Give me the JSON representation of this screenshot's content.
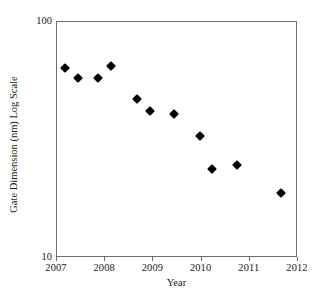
{
  "chart_data": {
    "type": "scatter",
    "title": "",
    "xlabel": "Year",
    "ylabel": "Gate Dimension (nm) Log Scale",
    "xlim": [
      2007,
      2012
    ],
    "ylim": [
      10,
      100
    ],
    "yscale": "log",
    "grid": false,
    "legend": null,
    "xticks": [
      "2007",
      "2008",
      "2009",
      "2010",
      "2011",
      "2012"
    ],
    "yticks": [
      "10",
      "100"
    ],
    "marker": "filled-diamond",
    "marker_color": "#000000",
    "series": [
      {
        "name": "Gate Dimension",
        "points": [
          {
            "x": 2007.19,
            "y": 63.0
          },
          {
            "x": 2007.46,
            "y": 57.5
          },
          {
            "x": 2007.87,
            "y": 57.5
          },
          {
            "x": 2008.14,
            "y": 64.5
          },
          {
            "x": 2008.68,
            "y": 46.5
          },
          {
            "x": 2008.95,
            "y": 41.5
          },
          {
            "x": 2009.45,
            "y": 40.2
          },
          {
            "x": 2009.99,
            "y": 32.5
          },
          {
            "x": 2010.24,
            "y": 23.7
          },
          {
            "x": 2010.76,
            "y": 24.6
          },
          {
            "x": 2011.67,
            "y": 18.6
          }
        ]
      }
    ]
  },
  "axes": {
    "x_title": "Year",
    "y_title": "Gate Dimension (nm) Log Scale",
    "x_tick_labels": [
      "2007",
      "2008",
      "2009",
      "2010",
      "2011",
      "2012"
    ],
    "y_tick_top": "100",
    "y_tick_bottom": "10"
  },
  "colors": {
    "frame": "#6e6e6e",
    "marker": "#000000",
    "background": "#ffffff",
    "text": "#1a1a1a"
  }
}
